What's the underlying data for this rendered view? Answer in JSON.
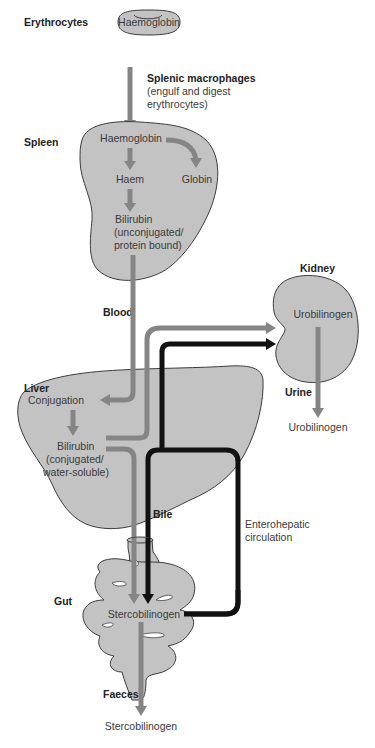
{
  "diagram": {
    "colors": {
      "organ_fill": "#c3c3c3",
      "organ_stroke": "#3c3c3c",
      "grey_arrow": "#858585",
      "black_arrow": "#111111",
      "text": "#3a3a3a"
    },
    "erythrocytes": {
      "label": "Erythrocytes",
      "content": "Haemoglobin"
    },
    "splenic": {
      "title": "Splenic macrophages",
      "line1": "(engulf and digest",
      "line2": "erythrocytes)"
    },
    "spleen": {
      "label": "Spleen",
      "haemoglobin": "Haemoglobin",
      "haem": "Haem",
      "globin": "Globin",
      "bilirubin": "Bilirubin",
      "bilirubin_line2": "(unconjugated/",
      "bilirubin_line3": "protein bound)"
    },
    "blood": {
      "label": "Blood"
    },
    "kidney": {
      "label": "Kidney",
      "content": "Urobilinogen"
    },
    "urine": {
      "label": "Urine",
      "output": "Urobilinogen"
    },
    "liver": {
      "label": "Liver",
      "conjugation": "Conjugation",
      "bilirubin": "Bilirubin",
      "bilirubin_line2": "(conjugated/",
      "bilirubin_line3": "water-soluble)"
    },
    "bile": {
      "label": "Bile"
    },
    "enterohepatic": {
      "line1": "Enterohepatic",
      "line2": "circulation"
    },
    "gut": {
      "label": "Gut",
      "content": "Stercobilinogen"
    },
    "faeces": {
      "label": "Faeces",
      "output": "Stercobilinogen"
    }
  }
}
